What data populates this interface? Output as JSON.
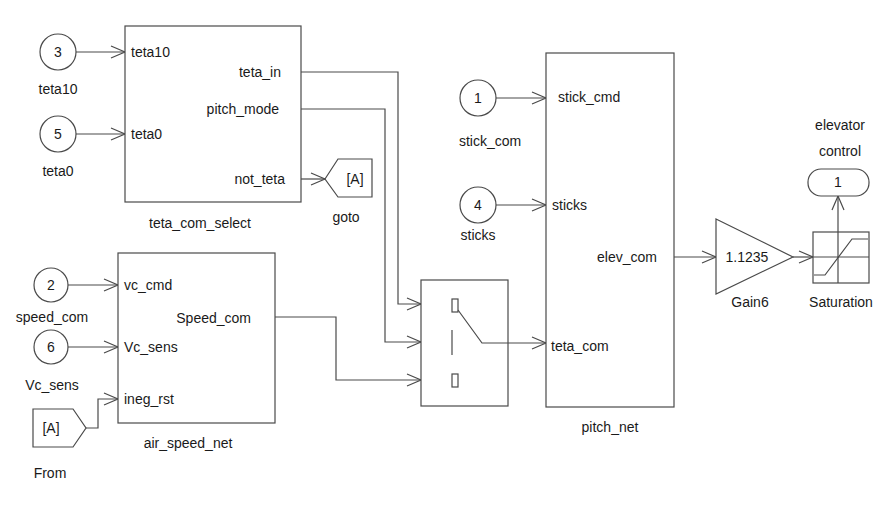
{
  "diagram": {
    "type": "simulink-block-diagram",
    "inports": [
      {
        "number": "3",
        "label": "teta10"
      },
      {
        "number": "5",
        "label": "teta0"
      },
      {
        "number": "1",
        "label": "stick_com"
      },
      {
        "number": "4",
        "label": "sticks"
      },
      {
        "number": "2",
        "label": "speed_com"
      },
      {
        "number": "6",
        "label": "Vc_sens"
      }
    ],
    "teta_com_select": {
      "name": "teta_com_select",
      "inputs": [
        "teta10",
        "teta0"
      ],
      "outputs": [
        "teta_in",
        "pitch_mode",
        "not_teta"
      ]
    },
    "goto": {
      "tag": "[A]",
      "name": "goto"
    },
    "from": {
      "tag": "[A]",
      "name": "From"
    },
    "air_speed_net": {
      "name": "air_speed_net",
      "inputs": [
        "vc_cmd",
        "Vc_sens",
        "ineg_rst"
      ],
      "outputs": [
        "Speed_com"
      ]
    },
    "switch": {
      "name": "switch"
    },
    "pitch_net": {
      "name": "pitch_net",
      "inputs": [
        "stick_cmd",
        "sticks",
        "teta_com"
      ],
      "outputs": [
        "elev_com"
      ]
    },
    "gain": {
      "value": "1.1235",
      "name": "Gain6"
    },
    "saturation": {
      "name": "Saturation"
    },
    "outport": {
      "number": "1",
      "label_line1": "elevator",
      "label_line2": "control"
    },
    "colors": {
      "stroke": "#4a4a4a",
      "text": "#1a1a1a",
      "background": "#ffffff"
    }
  }
}
